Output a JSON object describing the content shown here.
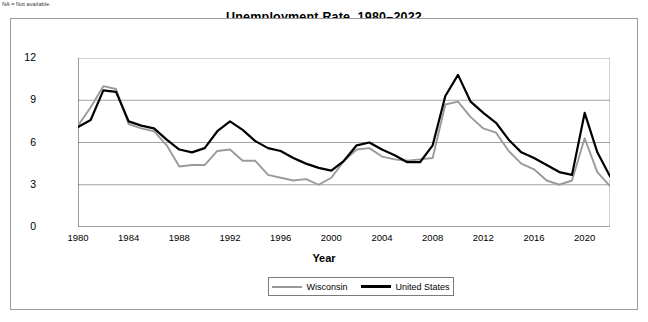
{
  "note": "NA = Not available.",
  "chart_data": {
    "type": "line",
    "title": "Unemployment Rate, 1980–2022",
    "xlabel": "Year",
    "ylabel": "Percent",
    "ylim": [
      0,
      12
    ],
    "xlim": [
      1980,
      2022
    ],
    "yticks": [
      0,
      3,
      6,
      9,
      12
    ],
    "xticks": [
      1980,
      1984,
      1988,
      1992,
      1996,
      2000,
      2004,
      2008,
      2012,
      2016,
      2020
    ],
    "grid": true,
    "legend_position": "bottom",
    "x": [
      1980,
      1981,
      1982,
      1983,
      1984,
      1985,
      1986,
      1987,
      1988,
      1989,
      1990,
      1991,
      1992,
      1993,
      1994,
      1995,
      1996,
      1997,
      1998,
      1999,
      2000,
      2001,
      2002,
      2003,
      2004,
      2005,
      2006,
      2007,
      2008,
      2009,
      2010,
      2011,
      2012,
      2013,
      2014,
      2015,
      2016,
      2017,
      2018,
      2019,
      2020,
      2021,
      2022
    ],
    "series": [
      {
        "name": "Wisconsin",
        "color": "#9a9a9a",
        "values": [
          7.2,
          8.5,
          10.0,
          9.8,
          7.3,
          7.0,
          6.8,
          5.8,
          4.3,
          4.4,
          4.4,
          5.4,
          5.5,
          4.7,
          4.7,
          3.7,
          3.5,
          3.3,
          3.4,
          3.0,
          3.5,
          4.7,
          5.5,
          5.6,
          5.0,
          4.8,
          4.7,
          4.8,
          4.9,
          8.7,
          8.9,
          7.8,
          7.0,
          6.7,
          5.4,
          4.5,
          4.1,
          3.3,
          3.0,
          3.3,
          6.3,
          3.9,
          2.9
        ]
      },
      {
        "name": "United States",
        "color": "#000000",
        "values": [
          7.1,
          7.6,
          9.7,
          9.6,
          7.5,
          7.2,
          7.0,
          6.2,
          5.5,
          5.3,
          5.6,
          6.8,
          7.5,
          6.9,
          6.1,
          5.6,
          5.4,
          4.9,
          4.5,
          4.2,
          4.0,
          4.7,
          5.8,
          6.0,
          5.5,
          5.1,
          4.6,
          4.6,
          5.8,
          9.3,
          10.8,
          8.9,
          8.1,
          7.4,
          6.2,
          5.3,
          4.9,
          4.4,
          3.9,
          3.7,
          8.1,
          5.3,
          3.6
        ]
      }
    ]
  }
}
